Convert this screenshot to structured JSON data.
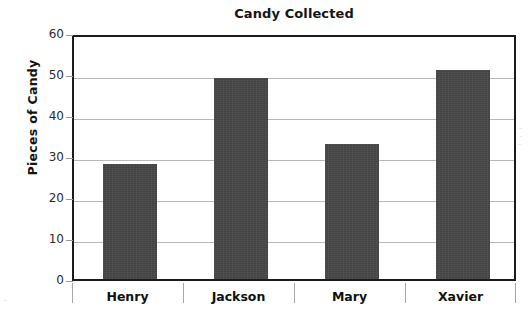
{
  "chart_data": {
    "type": "bar",
    "title": "Candy Collected",
    "xlabel": "",
    "ylabel": "Pieces of Candy",
    "categories": [
      "Henry",
      "Jackson",
      "Mary",
      "Xavier"
    ],
    "values": [
      28,
      49,
      33,
      51
    ],
    "ylim": [
      0,
      60
    ],
    "yticks": [
      0,
      10,
      20,
      30,
      40,
      50,
      60
    ],
    "ytick_labels": [
      "0",
      "10",
      "20",
      "30",
      "40",
      "50",
      "60"
    ],
    "grid": true,
    "legend": null,
    "series": [
      {
        "name": "Pieces of Candy",
        "values": [
          28,
          49,
          33,
          51
        ],
        "color": "#464646"
      }
    ]
  },
  "style": {
    "bar_color": "#464646",
    "gridline_color": "#b9b9b9",
    "frame_color": "#1b1b1b",
    "text_color": "#151515",
    "background": "#ffffff"
  }
}
